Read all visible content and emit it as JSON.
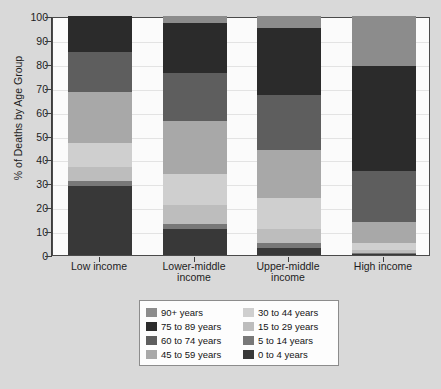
{
  "chart_data": {
    "type": "bar",
    "subtype": "stacked-100-percent",
    "title": "",
    "xlabel": "",
    "ylabel": "% of Deaths by Age Group",
    "ylim": [
      0,
      100
    ],
    "ytick_labels": [
      "100",
      "90",
      "80",
      "70",
      "60",
      "50",
      "40",
      "30",
      "20",
      "10",
      "0"
    ],
    "ytick_values": [
      100,
      90,
      80,
      70,
      60,
      50,
      40,
      30,
      20,
      10,
      0
    ],
    "grid": true,
    "legend_position": "bottom-center",
    "categories": [
      "Low income",
      "Lower-middle income",
      "Upper-middle income",
      "High income"
    ],
    "series": [
      {
        "name": "90+ years",
        "color": "#8c8c8c",
        "values": [
          0,
          3,
          5,
          21
        ]
      },
      {
        "name": "75 to 89 years",
        "color": "#2b2b2b",
        "values": [
          15,
          21,
          28,
          44
        ]
      },
      {
        "name": "60 to 74 years",
        "color": "#5e5e5e",
        "values": [
          17,
          20,
          23,
          21
        ]
      },
      {
        "name": "45 to 59 years",
        "color": "#a8a8a8",
        "values": [
          21,
          22,
          20,
          9
        ]
      },
      {
        "name": "30 to 44 years",
        "color": "#cfcfcf",
        "values": [
          10,
          13,
          13,
          3
        ]
      },
      {
        "name": "15 to 29 years",
        "color": "#bdbdbd",
        "values": [
          6,
          8,
          6,
          1
        ]
      },
      {
        "name": "5 to 14 years",
        "color": "#787878",
        "values": [
          2,
          2,
          2,
          0.5
        ]
      },
      {
        "name": "0 to 4 years",
        "color": "#383838",
        "values": [
          29,
          11,
          3,
          0.5
        ]
      }
    ]
  },
  "axis": {
    "y_title": "% of Deaths by Age Group"
  },
  "legend": {
    "column_left": [
      {
        "label": "90+ years",
        "color": "#8c8c8c"
      },
      {
        "label": "75 to 89 years",
        "color": "#2b2b2b"
      },
      {
        "label": "60 to 74 years",
        "color": "#5e5e5e"
      },
      {
        "label": "45 to 59 years",
        "color": "#a8a8a8"
      }
    ],
    "column_right": [
      {
        "label": "30 to 44 years",
        "color": "#cfcfcf"
      },
      {
        "label": "15 to 29 years",
        "color": "#bdbdbd"
      },
      {
        "label": "5 to 14 years",
        "color": "#787878"
      },
      {
        "label": "0 to 4 years",
        "color": "#383838"
      }
    ]
  }
}
